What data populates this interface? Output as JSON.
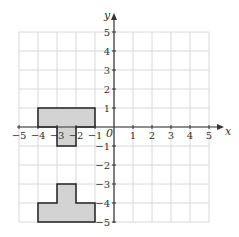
{
  "diagram": {
    "type": "coordinate-grid",
    "x_axis": {
      "label": "x",
      "min": -5,
      "max": 5,
      "ticks": [
        "-5",
        "-4",
        "-3",
        "-2",
        "-1",
        "1",
        "2",
        "3",
        "4",
        "5"
      ]
    },
    "y_axis": {
      "label": "y",
      "min": -5,
      "max": 5,
      "ticks": [
        "5",
        "4",
        "3",
        "2",
        "1",
        "-1",
        "-2",
        "-3",
        "-4",
        "-5"
      ]
    },
    "origin_label": "0",
    "colors": {
      "grid": "#d8d8d8",
      "axis": "#333333",
      "shape_fill": "#d3d3d3",
      "shape_stroke": "#222222"
    },
    "shapes": [
      {
        "name": "shape-A",
        "vertices": [
          [
            -4,
            1
          ],
          [
            -1,
            1
          ],
          [
            -1,
            0
          ],
          [
            -2,
            0
          ],
          [
            -2,
            -1
          ],
          [
            -3,
            -1
          ],
          [
            -3,
            0
          ],
          [
            -4,
            0
          ]
        ]
      },
      {
        "name": "shape-B",
        "vertices": [
          [
            -3,
            -3
          ],
          [
            -2,
            -3
          ],
          [
            -2,
            -4
          ],
          [
            -1,
            -4
          ],
          [
            -1,
            -5
          ],
          [
            -4,
            -5
          ],
          [
            -4,
            -4
          ],
          [
            -3,
            -4
          ]
        ]
      }
    ]
  }
}
